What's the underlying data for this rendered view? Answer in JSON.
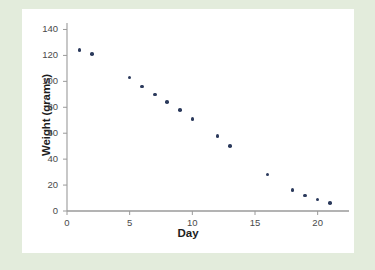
{
  "figure": {
    "background_outer": "#e3ecdc",
    "background_plot": "#ffffff",
    "marker_color": "#2b3a5c",
    "axis_color": "#9a9a9a"
  },
  "chart_data": {
    "type": "scatter",
    "title": "",
    "xlabel": "Day",
    "ylabel": "Weight (grams)",
    "xlim": [
      0,
      22.5
    ],
    "ylim": [
      0,
      145
    ],
    "xticks": [
      0,
      5,
      10,
      15,
      20
    ],
    "yticks": [
      0,
      20,
      40,
      60,
      80,
      100,
      120,
      140
    ],
    "xtick_labels": [
      "0",
      "5",
      "10",
      "15",
      "20"
    ],
    "ytick_labels": [
      "0",
      "20",
      "40",
      "60",
      "80",
      "100",
      "120",
      "140"
    ],
    "grid": false,
    "legend": null,
    "series": [
      {
        "name": "Weight",
        "x": [
          1,
          2,
          5,
          6,
          7,
          8,
          9,
          10,
          12,
          13,
          16,
          18,
          19,
          20,
          21
        ],
        "y": [
          124,
          121,
          103,
          96,
          90,
          84,
          78,
          71,
          58,
          50,
          28,
          16,
          12,
          9,
          6
        ]
      }
    ]
  }
}
